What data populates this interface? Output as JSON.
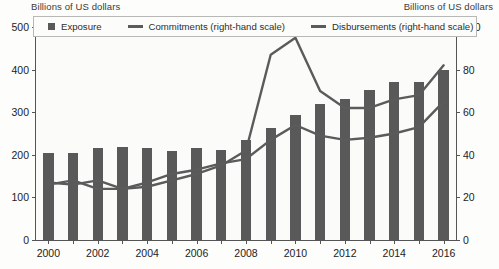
{
  "header": {
    "left_axis_title": "Billions of US dollars",
    "right_axis_title": "Billions of US dollars"
  },
  "legend": {
    "position": "top",
    "items": [
      {
        "label": "Exposure",
        "marker": "square",
        "color": "#595959"
      },
      {
        "label": "Commitments (right-hand scale)",
        "marker": "line",
        "color": "#5b5b5b"
      },
      {
        "label": "Disbursements (right-hand scale)",
        "marker": "line",
        "color": "#5b5b5b"
      }
    ]
  },
  "chart_data": {
    "type": "bar",
    "title": "",
    "subtitle": "",
    "xlabel": "",
    "ylabel": "Billions of US dollars",
    "y2label": "Billions of US dollars",
    "grid": false,
    "legend_position": "top",
    "categories": [
      2000,
      2001,
      2002,
      2003,
      2004,
      2005,
      2006,
      2007,
      2008,
      2009,
      2010,
      2011,
      2012,
      2013,
      2014,
      2015,
      2016
    ],
    "x_tick_labels": [
      "2000",
      "2002",
      "2004",
      "2006",
      "2008",
      "2010",
      "2012",
      "2014",
      "2016"
    ],
    "y_tick_labels": [
      "0",
      "100",
      "200",
      "300",
      "400",
      "500"
    ],
    "y2_tick_labels": [
      "0",
      "20",
      "40",
      "60",
      "80",
      "100"
    ],
    "ylim": [
      0,
      500
    ],
    "y2lim": [
      0,
      100
    ],
    "series": [
      {
        "name": "Exposure",
        "type": "bar",
        "axis": "left",
        "color": "#595959",
        "values": [
          205,
          205,
          215,
          218,
          215,
          210,
          215,
          212,
          235,
          262,
          293,
          320,
          330,
          352,
          372,
          372,
          400
        ]
      },
      {
        "name": "Commitments (right-hand scale)",
        "type": "line",
        "axis": "right",
        "color": "#5b5b5b",
        "values": [
          27,
          26,
          28,
          24,
          25,
          28,
          31,
          35,
          42,
          87,
          95,
          70,
          62,
          62,
          66,
          68,
          82
        ]
      },
      {
        "name": "Disbursements (right-hand scale)",
        "type": "line",
        "axis": "right",
        "color": "#5b5b5b",
        "values": [
          26,
          28,
          24,
          24,
          27,
          31,
          33,
          36,
          38,
          47,
          54,
          49,
          47,
          48,
          50,
          53,
          65
        ]
      }
    ]
  }
}
